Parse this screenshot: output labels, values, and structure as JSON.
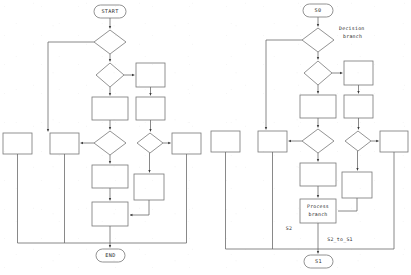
{
  "figure": {
    "background_color": "#ffffff",
    "line_color": "#6b6b6b",
    "text_color": "#2a2a2a"
  },
  "left_diagram": {
    "name": "state-machine-flowchart-generic",
    "start_terminator": "START",
    "end_terminator": "END",
    "node_counts": {
      "terminators": 2,
      "decisions": 5,
      "processes": 9
    }
  },
  "right_diagram": {
    "name": "state-machine-flowchart-annotated",
    "start_terminator": "S0",
    "end_terminator": "S1",
    "annotations": {
      "decision_branch": "Decision\nbranch",
      "decision_branch_line1": "Decision",
      "decision_branch_line2": "branch",
      "process_branch_line1": "Process",
      "process_branch_line2": "branch",
      "state_label": "S2",
      "transition_label": "S2_to_S1"
    },
    "node_counts": {
      "terminators": 2,
      "decisions": 5,
      "processes": 10
    }
  }
}
